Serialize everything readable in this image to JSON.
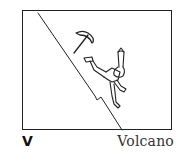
{
  "card": {
    "letter": "V",
    "word": "Volcano",
    "illustration": "climber-falling-down-slope-with-ice-axe"
  },
  "colors": {
    "ink": "#222222",
    "background": "#ffffff"
  }
}
